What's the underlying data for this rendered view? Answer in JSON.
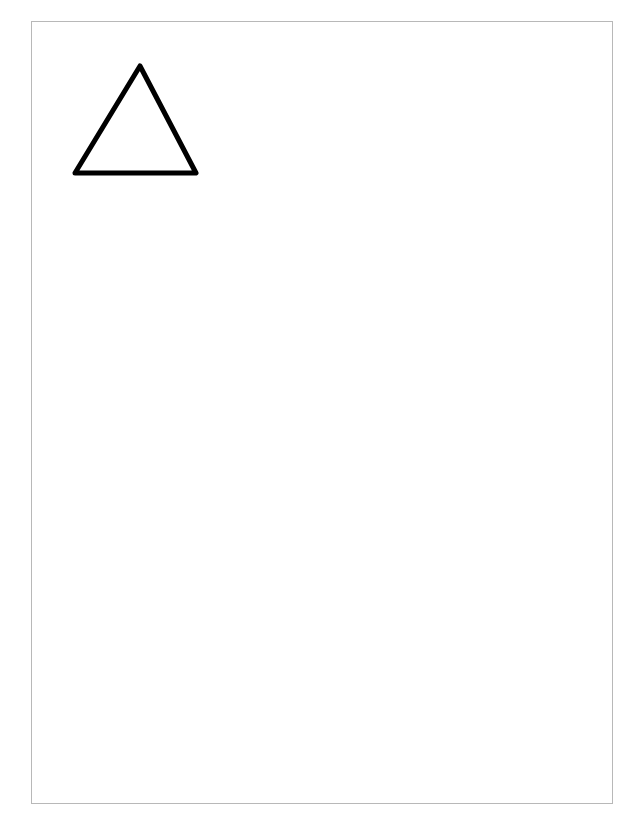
{
  "page": {
    "border_color": "#b8b8b8",
    "background": "#ffffff"
  },
  "shapes": [
    {
      "type": "triangle",
      "label": "outline-triangle",
      "points": [
        [
          140,
          66
        ],
        [
          196,
          173
        ],
        [
          75,
          173
        ]
      ],
      "stroke": "#000000",
      "stroke_width": 5,
      "fill": "none"
    }
  ]
}
